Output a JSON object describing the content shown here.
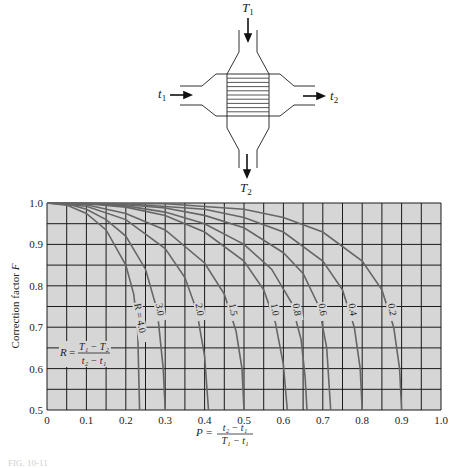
{
  "diagram": {
    "inlet_hot": "T",
    "inlet_hot_sub": "1",
    "outlet_hot": "T",
    "outlet_hot_sub": "2",
    "inlet_cold": "t",
    "inlet_cold_sub": "1",
    "outlet_cold": "t",
    "outlet_cold_sub": "2"
  },
  "chart_data": {
    "type": "line",
    "title": "",
    "xlabel": "P = (t2 - t1)/(T1 - t1)",
    "ylabel": "Correction factor F",
    "xlim": [
      0,
      1.0
    ],
    "ylim": [
      0.5,
      1.0
    ],
    "grid": true,
    "x_ticks": [
      "0",
      "0.1",
      "0.2",
      "0.3",
      "0.4",
      "0.5",
      "0.6",
      "0.7",
      "0.8",
      "0.9",
      "1.0"
    ],
    "y_ticks": [
      "0.5",
      "0.6",
      "0.7",
      "0.8",
      "0.9",
      "1.0"
    ],
    "annotation": "R = (T1 - T2)/(t2 - t1)",
    "series": [
      {
        "name": "R = 4.0",
        "label": "R = 4.0",
        "p_end": 0.235,
        "points": [
          [
            0,
            1.0
          ],
          [
            0.05,
            0.995
          ],
          [
            0.1,
            0.975
          ],
          [
            0.15,
            0.935
          ],
          [
            0.2,
            0.85
          ],
          [
            0.22,
            0.78
          ],
          [
            0.23,
            0.7
          ],
          [
            0.235,
            0.5
          ]
        ]
      },
      {
        "name": "R = 3.0",
        "label": "3.0",
        "p_end": 0.3,
        "points": [
          [
            0,
            1.0
          ],
          [
            0.05,
            0.998
          ],
          [
            0.1,
            0.985
          ],
          [
            0.15,
            0.96
          ],
          [
            0.2,
            0.92
          ],
          [
            0.25,
            0.84
          ],
          [
            0.28,
            0.74
          ],
          [
            0.295,
            0.6
          ],
          [
            0.3,
            0.5
          ]
        ]
      },
      {
        "name": "R = 2.0",
        "label": "2.0",
        "p_end": 0.41,
        "points": [
          [
            0,
            1.0
          ],
          [
            0.1,
            0.992
          ],
          [
            0.2,
            0.96
          ],
          [
            0.3,
            0.89
          ],
          [
            0.35,
            0.82
          ],
          [
            0.38,
            0.74
          ],
          [
            0.4,
            0.63
          ],
          [
            0.41,
            0.5
          ]
        ]
      },
      {
        "name": "R = 1.5",
        "label": "1.5",
        "p_end": 0.5,
        "points": [
          [
            0,
            1.0
          ],
          [
            0.1,
            0.996
          ],
          [
            0.2,
            0.975
          ],
          [
            0.3,
            0.935
          ],
          [
            0.4,
            0.855
          ],
          [
            0.45,
            0.78
          ],
          [
            0.48,
            0.69
          ],
          [
            0.495,
            0.6
          ],
          [
            0.5,
            0.5
          ]
        ]
      },
      {
        "name": "R = 1.0",
        "label": "1.0",
        "p_end": 0.61,
        "points": [
          [
            0,
            1.0
          ],
          [
            0.1,
            0.998
          ],
          [
            0.2,
            0.99
          ],
          [
            0.3,
            0.97
          ],
          [
            0.4,
            0.93
          ],
          [
            0.5,
            0.86
          ],
          [
            0.55,
            0.79
          ],
          [
            0.58,
            0.71
          ],
          [
            0.6,
            0.61
          ],
          [
            0.61,
            0.5
          ]
        ]
      },
      {
        "name": "R = 0.8",
        "label": "0.8",
        "p_end": 0.66,
        "points": [
          [
            0,
            1.0
          ],
          [
            0.1,
            0.999
          ],
          [
            0.2,
            0.993
          ],
          [
            0.3,
            0.978
          ],
          [
            0.4,
            0.95
          ],
          [
            0.5,
            0.9
          ],
          [
            0.57,
            0.84
          ],
          [
            0.62,
            0.76
          ],
          [
            0.645,
            0.67
          ],
          [
            0.655,
            0.58
          ],
          [
            0.66,
            0.5
          ]
        ]
      },
      {
        "name": "R = 0.6",
        "label": "0.6",
        "p_end": 0.72,
        "points": [
          [
            0,
            1.0
          ],
          [
            0.2,
            0.996
          ],
          [
            0.3,
            0.988
          ],
          [
            0.4,
            0.97
          ],
          [
            0.5,
            0.94
          ],
          [
            0.6,
            0.88
          ],
          [
            0.65,
            0.83
          ],
          [
            0.69,
            0.75
          ],
          [
            0.71,
            0.65
          ],
          [
            0.72,
            0.5
          ]
        ]
      },
      {
        "name": "R = 0.4",
        "label": "0.4",
        "p_end": 0.8,
        "points": [
          [
            0,
            1.0
          ],
          [
            0.2,
            0.998
          ],
          [
            0.4,
            0.985
          ],
          [
            0.5,
            0.965
          ],
          [
            0.6,
            0.93
          ],
          [
            0.7,
            0.86
          ],
          [
            0.75,
            0.79
          ],
          [
            0.78,
            0.7
          ],
          [
            0.795,
            0.6
          ],
          [
            0.8,
            0.5
          ]
        ]
      },
      {
        "name": "R = 0.2",
        "label": "0.2",
        "p_end": 0.9,
        "points": [
          [
            0,
            1.0
          ],
          [
            0.3,
            0.998
          ],
          [
            0.5,
            0.985
          ],
          [
            0.6,
            0.965
          ],
          [
            0.7,
            0.93
          ],
          [
            0.8,
            0.86
          ],
          [
            0.85,
            0.79
          ],
          [
            0.88,
            0.7
          ],
          [
            0.895,
            0.6
          ],
          [
            0.9,
            0.5
          ]
        ]
      }
    ]
  },
  "labels": {
    "y_axis": "Correction factor ",
    "y_axis_var": "F",
    "x_axis_var": "P",
    "x_axis_num": "t₂ − t₁",
    "x_axis_den": "T₁ − t₁",
    "r_var": "R",
    "r_num": "T₁ − T₂",
    "r_den": "t₂ − t₁",
    "caption": "FIG. 10-11"
  }
}
